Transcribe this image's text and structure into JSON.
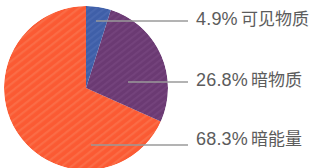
{
  "chart_data": {
    "type": "pie",
    "title": "",
    "subtitle": "",
    "categories": [
      "可见物质",
      "暗物质",
      "暗能量"
    ],
    "values": [
      4.9,
      26.8,
      68.3
    ],
    "value_unit": "%",
    "labels": [
      "4.9% 可见物质",
      "26.8% 暗物质",
      "68.3% 暗能量"
    ],
    "colors": [
      "#3f5fa8",
      "#6b3a73",
      "#fb5a33"
    ],
    "legend_position": "right-leader-lines",
    "grid": false,
    "slices": [
      {
        "name": "可见物质",
        "percent_text": "4.9%",
        "value": 4.9,
        "color": "#3f5fa8",
        "start_angle_deg": 0,
        "end_angle_deg": 17.64
      },
      {
        "name": "暗物质",
        "percent_text": "26.8%",
        "value": 26.8,
        "color": "#6b3a73",
        "start_angle_deg": 17.64,
        "end_angle_deg": 114.12
      },
      {
        "name": "暗能量",
        "percent_text": "68.3%",
        "value": 68.3,
        "color": "#fb5a33",
        "start_angle_deg": 114.12,
        "end_angle_deg": 360
      }
    ],
    "geometry": {
      "center_x": 86,
      "center_y": 88,
      "radius": 82
    },
    "leader_lines": [
      {
        "name": "可见物质",
        "x1": 96,
        "y1": 21,
        "x2": 188,
        "y2": 21,
        "color": "#9a9a9a"
      },
      {
        "name": "暗物质",
        "x1": 128,
        "y1": 82,
        "x2": 188,
        "y2": 82,
        "color": "#9a9a9a"
      },
      {
        "name": "暗能量",
        "x1": 91,
        "y1": 145,
        "x2": 188,
        "y2": 145,
        "color": "#9a9a9a"
      }
    ],
    "text_color": "#5c5c5c",
    "background_color": "#ffffff"
  },
  "labels": {
    "visible_matter": {
      "percent": "4.9%",
      "name": "可见物质"
    },
    "dark_matter": {
      "percent": "26.8%",
      "name": "暗物质"
    },
    "dark_energy": {
      "percent": "68.3%",
      "name": "暗能量"
    }
  }
}
